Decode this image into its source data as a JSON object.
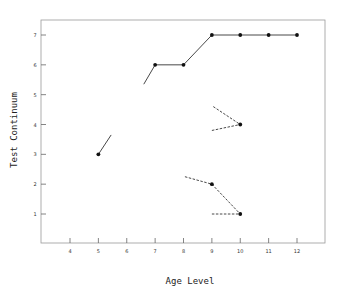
{
  "chart_data": {
    "type": "line",
    "title": "",
    "xlabel": "Age Level",
    "ylabel": "Test Continuum",
    "xlim": [
      3,
      13
    ],
    "ylim": [
      0,
      7.3
    ],
    "x_ticks": [
      4,
      5,
      6,
      7,
      8,
      9,
      10,
      11,
      12
    ],
    "y_ticks": [
      1,
      2,
      3,
      4,
      5,
      6,
      7
    ],
    "grid": false,
    "legend": null,
    "series": [
      {
        "name": "solid-path",
        "style": "solid",
        "points": [
          {
            "x": 5,
            "y": 3
          },
          {
            "x": 7,
            "y": 6
          },
          {
            "x": 8,
            "y": 6
          },
          {
            "x": 9,
            "y": 7
          },
          {
            "x": 10,
            "y": 7
          },
          {
            "x": 11,
            "y": 7
          },
          {
            "x": 12,
            "y": 7
          }
        ],
        "fragments": [
          {
            "from": {
              "x": 5,
              "y": 3
            },
            "to": {
              "x": 5.45,
              "y": 3.65
            }
          },
          {
            "from": {
              "x": 6.6,
              "y": 5.35
            },
            "to": {
              "x": 7,
              "y": 6
            }
          }
        ]
      },
      {
        "name": "dashed-branch-upper",
        "style": "dashed",
        "points": [
          {
            "x": 10,
            "y": 4
          }
        ],
        "segments": [
          {
            "from": {
              "x": 9.05,
              "y": 4.6
            },
            "to": {
              "x": 10,
              "y": 4
            }
          },
          {
            "from": {
              "x": 9.0,
              "y": 3.8
            },
            "to": {
              "x": 10,
              "y": 4
            }
          }
        ]
      },
      {
        "name": "dashed-branch-lower",
        "style": "dashed",
        "points": [
          {
            "x": 9,
            "y": 2
          },
          {
            "x": 10,
            "y": 1
          }
        ],
        "segments": [
          {
            "from": {
              "x": 8.05,
              "y": 2.25
            },
            "to": {
              "x": 9,
              "y": 2
            }
          },
          {
            "from": {
              "x": 9,
              "y": 2
            },
            "to": {
              "x": 10,
              "y": 1
            }
          },
          {
            "from": {
              "x": 9.0,
              "y": 1.0
            },
            "to": {
              "x": 10,
              "y": 1
            }
          }
        ]
      }
    ]
  },
  "labels": {
    "xlabel": "Age Level",
    "ylabel": "Test Continuum",
    "x_ticks": [
      "4",
      "5",
      "6",
      "7",
      "8",
      "9",
      "10",
      "11",
      "12"
    ],
    "y_ticks": [
      "1",
      "2",
      "3",
      "4",
      "5",
      "6",
      "7"
    ]
  }
}
